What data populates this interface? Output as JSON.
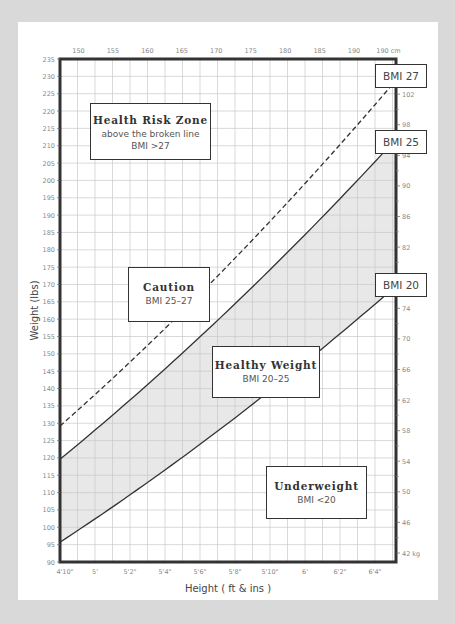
{
  "chart_data": {
    "type": "line",
    "xlabel": "Height ( ft & ins )",
    "ylabel": "Weight (lbs)",
    "x_units": "inches",
    "xlim": [
      58,
      77.2
    ],
    "ylim": [
      90,
      235
    ],
    "grid": true,
    "x_ticks_bottom": [
      "4'10\"",
      "5'",
      "5'2\"",
      "5'4\"",
      "5'6\"",
      "5'8\"",
      "5'10\"",
      "6'",
      "6'2\"",
      "6'4\""
    ],
    "x_ticks_top": [
      "150",
      "155",
      "160",
      "165",
      "170",
      "175",
      "180",
      "185",
      "190",
      "190 cm"
    ],
    "y_ticks_left": [
      90,
      95,
      100,
      105,
      110,
      115,
      120,
      125,
      130,
      135,
      140,
      145,
      150,
      155,
      160,
      165,
      170,
      175,
      180,
      185,
      190,
      195,
      200,
      205,
      210,
      215,
      220,
      225,
      230,
      235
    ],
    "y_ticks_right": [
      "102",
      "98",
      "94",
      "90",
      "86",
      "82",
      "78",
      "74",
      "70",
      "66",
      "62",
      "58",
      "54",
      "50",
      "46",
      "42 kg"
    ],
    "series": [
      {
        "name": "BMI 27",
        "style": "dashed",
        "x": [
          58,
          62,
          66,
          70,
          74,
          77.2
        ],
        "values": [
          129,
          148,
          167,
          188,
          210,
          228
        ]
      },
      {
        "name": "BMI 25",
        "style": "solid",
        "x": [
          58,
          62,
          66,
          70,
          74,
          77.2
        ],
        "values": [
          120,
          137,
          155,
          174,
          195,
          211
        ]
      },
      {
        "name": "BMI 20",
        "style": "solid",
        "x": [
          58,
          62,
          66,
          70,
          74,
          77.2
        ],
        "values": [
          96,
          109,
          124,
          139,
          156,
          169
        ]
      }
    ],
    "shaded_region": {
      "between": [
        "BMI 20",
        "BMI 25"
      ],
      "color": "#e8e8e8",
      "label": "Healthy Weight"
    },
    "annotations": [
      {
        "title": "Health Risk Zone",
        "lines": [
          "above the broken line",
          "BMI >27"
        ]
      },
      {
        "title": "Caution",
        "lines": [
          "BMI 25–27"
        ]
      },
      {
        "title": "Healthy Weight",
        "lines": [
          "BMI 20–25"
        ]
      },
      {
        "title": "Underweight",
        "lines": [
          "BMI <20"
        ]
      }
    ],
    "curve_labels": [
      "BMI 27",
      "BMI 25",
      "BMI 20"
    ]
  },
  "labels": {
    "xlabel": "Height ( ft & ins )",
    "ylabel": "Weight (lbs)",
    "risk_title": "Health Risk Zone",
    "risk_line1": "above the broken line",
    "risk_line2": "BMI >27",
    "caution_title": "Caution",
    "caution_sub": "BMI 25–27",
    "healthy_title": "Healthy Weight",
    "healthy_sub": "BMI 20–25",
    "under_title": "Underweight",
    "under_sub": "BMI <20",
    "bmi27": "BMI 27",
    "bmi25": "BMI 25",
    "bmi20": "BMI 20"
  },
  "colors": {
    "background": "#d9d9d9",
    "card": "#ffffff",
    "frame": "#333333",
    "grid": "#c8c8c8",
    "shade": "#e8e8e8",
    "curve": "#333333"
  }
}
